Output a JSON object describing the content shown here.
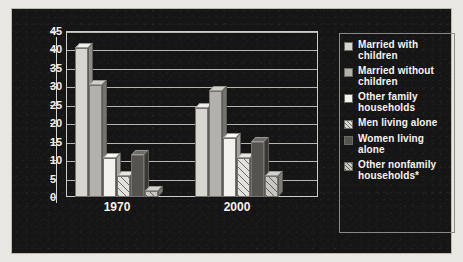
{
  "chart_data": {
    "type": "bar",
    "title": "",
    "xlabel": "",
    "ylabel": "",
    "categories": [
      "1970",
      "2000"
    ],
    "ylim": [
      0,
      45
    ],
    "yticks": [
      0,
      5,
      10,
      15,
      20,
      25,
      30,
      35,
      40,
      45
    ],
    "grid": true,
    "legend_position": "right",
    "series": [
      {
        "name": "Married with children",
        "swatch": "sw1",
        "values": [
          40.3,
          24.1
        ]
      },
      {
        "name": "Married without children",
        "swatch": "sw2",
        "values": [
          30.3,
          28.7
        ]
      },
      {
        "name": "Other family households",
        "swatch": "sw3",
        "values": [
          10.6,
          16.0
        ]
      },
      {
        "name": "Men living alone",
        "swatch": "sw4",
        "values": [
          5.6,
          10.7
        ]
      },
      {
        "name": "Women living alone",
        "swatch": "sw5",
        "values": [
          11.5,
          14.8
        ]
      },
      {
        "name": "Other nonfamily households*",
        "swatch": "sw6",
        "values": [
          1.7,
          5.7
        ]
      }
    ]
  },
  "legend": {
    "items": [
      {
        "label": "Married with children"
      },
      {
        "label": "Married without children"
      },
      {
        "label": "Other family households"
      },
      {
        "label": "Men living alone"
      },
      {
        "label": "Women living alone"
      },
      {
        "label": "Other nonfamily households*"
      }
    ]
  },
  "axis": {
    "y_tick_labels": [
      "45",
      "40",
      "35",
      "30",
      "25",
      "20",
      "15",
      "10",
      "5",
      "0"
    ],
    "x_tick_labels": [
      "1970",
      "2000"
    ]
  },
  "colors": {
    "panel_background": "#151515",
    "text": "#f4f2ee",
    "gridline": "#b9b6b0",
    "page_background": "#e9e7e2"
  }
}
